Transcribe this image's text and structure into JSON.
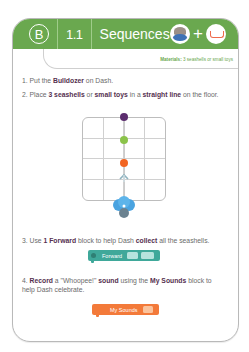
{
  "header": {
    "level": "B",
    "lesson_number": "1.1",
    "title": "Sequences",
    "icons": [
      "dash-robot-icon",
      "plus",
      "bulldozer-accessory-icon"
    ],
    "color": "#6aa84f"
  },
  "materials": {
    "label": "Materials:",
    "value": "3 seashells or small toys"
  },
  "steps": [
    {
      "number": "1.",
      "parts": [
        "Put the ",
        "Bulldozer",
        " on Dash."
      ]
    },
    {
      "number": "2.",
      "parts": [
        "Place ",
        "3 seashells",
        " or ",
        "small toys",
        " in a ",
        "straight line",
        " on the floor."
      ]
    },
    {
      "number": "3.",
      "parts": [
        "Use ",
        "1 Forward",
        " block to help Dash ",
        "collect",
        " all the seashells."
      ]
    },
    {
      "number": "4.",
      "parts": [
        "Record",
        " a \"Whoopee!\" ",
        "sound",
        " using the ",
        "My Sounds",
        " block to help Dash celebrate."
      ]
    }
  ],
  "diagram": {
    "grid": "4x4",
    "dots": [
      {
        "color": "#5b2d6e",
        "label": "top-dot"
      },
      {
        "color": "#8bc34a",
        "label": "middle-dot"
      },
      {
        "color": "#f26522",
        "label": "bottom-dot"
      }
    ],
    "arrow": "up",
    "robot": "Dash"
  },
  "blocks": {
    "forward": {
      "label": "Forward",
      "color": "#3fa89a"
    },
    "my_sounds": {
      "label": "My Sounds",
      "color": "#f37a3a"
    }
  }
}
